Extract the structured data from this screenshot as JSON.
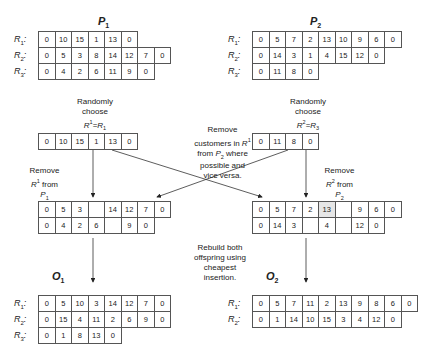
{
  "parents": {
    "p1": {
      "title": "P",
      "title_sub": "1",
      "routes": [
        {
          "label": "R",
          "sub": "1",
          "values": [
            "0",
            "10",
            "15",
            "1",
            "13",
            "0"
          ]
        },
        {
          "label": "R",
          "sub": "2",
          "values": [
            "0",
            "5",
            "3",
            "8",
            "14",
            "12",
            "7",
            "0"
          ]
        },
        {
          "label": "R",
          "sub": "3",
          "values": [
            "0",
            "4",
            "2",
            "6",
            "11",
            "9",
            "0"
          ]
        }
      ]
    },
    "p2": {
      "title": "P",
      "title_sub": "2",
      "routes": [
        {
          "label": "R",
          "sub": "1",
          "values": [
            "0",
            "5",
            "7",
            "2",
            "13",
            "10",
            "9",
            "6",
            "0"
          ]
        },
        {
          "label": "R",
          "sub": "2",
          "values": [
            "0",
            "14",
            "3",
            "1",
            "4",
            "15",
            "12",
            "0"
          ]
        },
        {
          "label": "R",
          "sub": "3",
          "values": [
            "0",
            "11",
            "8",
            "0"
          ]
        }
      ]
    }
  },
  "choose_left": {
    "line1": "Randomly",
    "line2": "choose",
    "line3": "R¹=R₁"
  },
  "choose_right": {
    "line1": "Randomly",
    "line2": "choose",
    "line3": "R²=R₃"
  },
  "chosen_left": [
    "0",
    "10",
    "15",
    "1",
    "13",
    "0"
  ],
  "chosen_right": [
    "0",
    "11",
    "8",
    "0"
  ],
  "center_note": {
    "line1": "Remove",
    "line2": "customers in R¹",
    "line3": "from P₂ where",
    "line4": "possible and",
    "line5": "vice versa."
  },
  "remove_left": {
    "line1": "Remove",
    "line2": "R¹ from",
    "line3": "P₁"
  },
  "remove_right": {
    "line1": "Remove",
    "line2": "R² from",
    "line3": "P₂"
  },
  "intermediate_left": [
    [
      "0",
      "5",
      "3",
      "",
      "14",
      "12",
      "7",
      "0"
    ],
    [
      "0",
      "4",
      "2",
      "6",
      "",
      "9",
      "0"
    ]
  ],
  "intermediate_right": [
    [
      "0",
      "5",
      "7",
      "2",
      "13",
      "",
      "9",
      "6",
      "0"
    ],
    [
      "0",
      "14",
      "3",
      "",
      "4",
      "",
      "12",
      "0"
    ]
  ],
  "rebuild_note": {
    "line1": "Rebuild both",
    "line2": "offspring using",
    "line3": "cheapest",
    "line4": "insertion."
  },
  "offspring": {
    "o1": {
      "title": "O",
      "title_sub": "1",
      "routes": [
        {
          "label": "R",
          "sub": "1",
          "values": [
            "0",
            "5",
            "10",
            "3",
            "14",
            "12",
            "7",
            "0"
          ]
        },
        {
          "label": "R",
          "sub": "2",
          "values": [
            "0",
            "15",
            "4",
            "11",
            "2",
            "6",
            "9",
            "0"
          ]
        },
        {
          "label": "R",
          "sub": "3",
          "values": [
            "0",
            "1",
            "8",
            "13",
            "0"
          ]
        }
      ]
    },
    "o2": {
      "title": "O",
      "title_sub": "2",
      "routes": [
        {
          "label": "R",
          "sub": "1",
          "values": [
            "0",
            "5",
            "7",
            "11",
            "2",
            "13",
            "9",
            "8",
            "6",
            "0"
          ]
        },
        {
          "label": "R",
          "sub": "2",
          "values": [
            "0",
            "1",
            "14",
            "10",
            "15",
            "3",
            "4",
            "12",
            "0"
          ]
        }
      ]
    }
  },
  "colors": {
    "border": "#555555",
    "highlight": "#e6e6e6",
    "text": "#222222"
  }
}
